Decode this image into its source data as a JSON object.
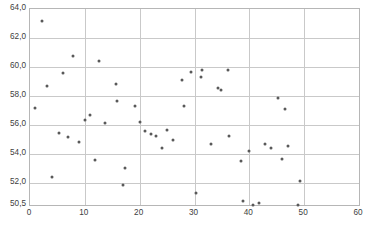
{
  "chart_data": {
    "type": "scatter",
    "title": "",
    "subtitle": "",
    "xlabel": "",
    "ylabel": "",
    "xlim": [
      0,
      60
    ],
    "ylim": [
      50.5,
      64.0
    ],
    "grid": true,
    "legend": null,
    "legend_position": "none",
    "x_ticks": [
      "0",
      "10",
      "20",
      "30",
      "40",
      "50",
      "60"
    ],
    "x_tick_values": [
      0,
      10,
      20,
      30,
      40,
      50,
      60
    ],
    "y_ticks": [
      "50,5",
      "52,0",
      "54,0",
      "56,0",
      "58,0",
      "60,0",
      "62,0",
      "64,0"
    ],
    "y_tick_values": [
      50.5,
      52.0,
      54.0,
      56.0,
      58.0,
      60.0,
      62.0,
      64.0
    ],
    "marker_color": "#595959",
    "grid_color": "#c9c9c9",
    "frame_color": "#b6b6b6",
    "series": [
      {
        "name": "series-1",
        "points": [
          [
            1.0,
            57.15
          ],
          [
            2.2,
            63.15
          ],
          [
            3.1,
            58.7
          ],
          [
            4.0,
            52.4
          ],
          [
            5.2,
            55.45
          ],
          [
            6.0,
            59.6
          ],
          [
            7.0,
            55.15
          ],
          [
            7.8,
            60.75
          ],
          [
            9.0,
            54.85
          ],
          [
            10.0,
            56.35
          ],
          [
            10.9,
            56.7
          ],
          [
            11.8,
            53.6
          ],
          [
            12.6,
            60.45
          ],
          [
            13.6,
            56.15
          ],
          [
            15.6,
            58.85
          ],
          [
            15.8,
            57.65
          ],
          [
            17.0,
            51.85
          ],
          [
            17.4,
            53.05
          ],
          [
            19.1,
            57.35
          ],
          [
            20.1,
            56.25
          ],
          [
            21.0,
            55.6
          ],
          [
            22.1,
            55.4
          ],
          [
            22.9,
            55.25
          ],
          [
            24.0,
            54.4
          ],
          [
            25.0,
            55.65
          ],
          [
            26.0,
            55.0
          ],
          [
            27.7,
            59.1
          ],
          [
            28.1,
            57.35
          ],
          [
            29.3,
            59.65
          ],
          [
            30.2,
            51.3
          ],
          [
            31.2,
            59.35
          ],
          [
            31.3,
            59.8
          ],
          [
            33.1,
            54.7
          ],
          [
            34.2,
            58.55
          ],
          [
            34.9,
            58.4
          ],
          [
            36.2,
            59.8
          ],
          [
            36.3,
            55.25
          ],
          [
            38.5,
            53.5
          ],
          [
            38.9,
            50.8
          ],
          [
            40.0,
            54.25
          ],
          [
            40.6,
            50.5
          ],
          [
            41.7,
            50.65
          ],
          [
            42.9,
            54.7
          ],
          [
            43.9,
            54.45
          ],
          [
            45.2,
            57.9
          ],
          [
            45.9,
            53.7
          ],
          [
            46.5,
            57.1
          ],
          [
            47.1,
            54.55
          ],
          [
            48.8,
            50.5
          ],
          [
            49.3,
            52.15
          ]
        ]
      }
    ]
  },
  "caption": {
    "text": ""
  }
}
